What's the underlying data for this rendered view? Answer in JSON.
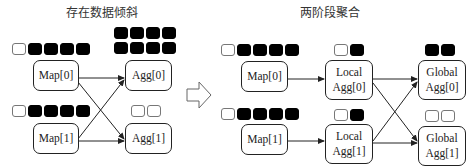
{
  "left_panel": {
    "title": "存在数据倾斜",
    "nodes": {
      "map0": "Map[0]",
      "map1": "Map[1]",
      "agg0": "Agg[0]",
      "agg1": "Agg[1]"
    },
    "data_blocks": {
      "map0": {
        "hollow": 1,
        "filled": 4
      },
      "map1": {
        "hollow": 1,
        "filled": 4
      },
      "agg0": {
        "hollow": 0,
        "filled": 8,
        "rows": 2
      },
      "agg1": {
        "hollow": 2,
        "filled": 0
      }
    }
  },
  "transition_arrow": "hollow-right-arrow",
  "right_panel": {
    "title": "两阶段聚合",
    "nodes": {
      "map0": "Map[0]",
      "map1": "Map[1]",
      "local_agg0_line1": "Local",
      "local_agg0_line2": "Agg[0]",
      "local_agg1_line1": "Local",
      "local_agg1_line2": "Agg[1]",
      "global_agg0_line1": "Global",
      "global_agg0_line2": "Agg[0]",
      "global_agg1_line1": "Global",
      "global_agg1_line2": "Agg[1]"
    },
    "data_blocks": {
      "map0": {
        "hollow": 1,
        "filled": 4
      },
      "map1": {
        "hollow": 1,
        "filled": 4
      },
      "local_agg0": {
        "hollow": 1,
        "filled": 1
      },
      "local_agg1": {
        "hollow": 1,
        "filled": 1
      },
      "global_agg0": {
        "hollow": 0,
        "filled": 2
      },
      "global_agg1": {
        "hollow": 2,
        "filled": 0
      }
    }
  },
  "colors": {
    "filled_block": "#000000",
    "hollow_block_border": "#777777",
    "line": "#222222"
  }
}
